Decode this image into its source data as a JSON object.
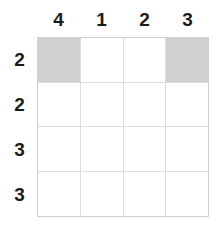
{
  "grid": {
    "rows": 4,
    "columns": 4,
    "column_headers": [
      "4",
      "1",
      "2",
      "3"
    ],
    "row_headers": [
      "2",
      "2",
      "3",
      "3"
    ],
    "colors": {
      "filled_cell": "#d0d0d0",
      "empty_cell": "#ffffff",
      "gridline": "#dcdcdc",
      "border": "#cfcfcf",
      "label_text": "#1b1b1b"
    },
    "cells": [
      [
        {
          "state": "filled"
        },
        {
          "state": "empty"
        },
        {
          "state": "empty"
        },
        {
          "state": "filled"
        }
      ],
      [
        {
          "state": "empty"
        },
        {
          "state": "empty"
        },
        {
          "state": "empty"
        },
        {
          "state": "empty"
        }
      ],
      [
        {
          "state": "empty"
        },
        {
          "state": "empty"
        },
        {
          "state": "empty"
        },
        {
          "state": "empty"
        }
      ],
      [
        {
          "state": "empty"
        },
        {
          "state": "empty"
        },
        {
          "state": "empty"
        },
        {
          "state": "empty"
        }
      ]
    ]
  }
}
